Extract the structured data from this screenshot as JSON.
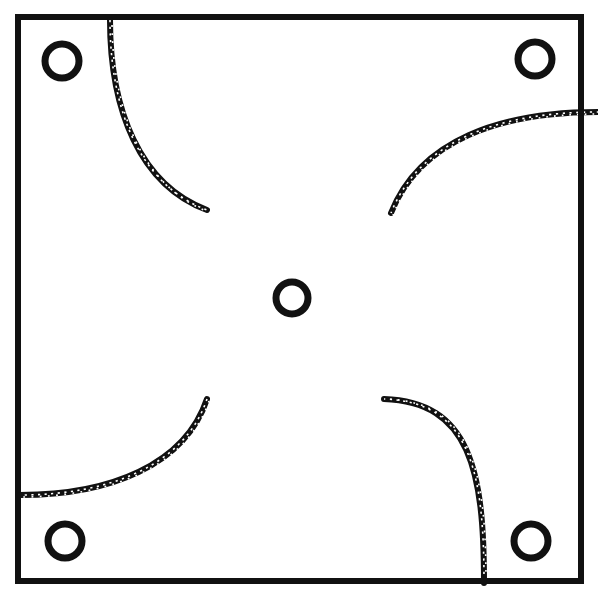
{
  "figure": {
    "canvas": {
      "width": 598,
      "height": 595,
      "background": "#ffffff"
    },
    "ink_color": "#111111",
    "frame": {
      "name": "outer-square-frame",
      "x": 18,
      "y": 17,
      "width": 563,
      "height": 564,
      "stroke_width": 6,
      "stroke_color": "#111111",
      "fill": "none"
    },
    "rings": [
      {
        "id": "ring-top-left",
        "label": "top-left hole",
        "cx": 62,
        "cy": 61,
        "r": 17,
        "stroke_width": 7
      },
      {
        "id": "ring-top-right",
        "label": "top-right hole",
        "cx": 535,
        "cy": 59,
        "r": 17,
        "stroke_width": 7
      },
      {
        "id": "ring-center",
        "label": "center hole",
        "cx": 292,
        "cy": 298,
        "r": 16,
        "stroke_width": 7
      },
      {
        "id": "ring-bottom-left",
        "label": "bottom-left hole",
        "cx": 65,
        "cy": 541,
        "r": 17,
        "stroke_width": 7
      },
      {
        "id": "ring-bottom-right",
        "label": "bottom-right hole",
        "cx": 531,
        "cy": 541,
        "r": 17,
        "stroke_width": 7
      }
    ],
    "arcs": [
      {
        "id": "arc-upper-left",
        "label": "upper-left pinwheel arc",
        "path": "M 110 20 C 110 110, 140 185, 207 210",
        "stroke_width": 6
      },
      {
        "id": "arc-upper-right",
        "label": "upper-right pinwheel arc",
        "path": "M 598 112 C 500 112, 420 140, 391 213",
        "stroke_width": 6
      },
      {
        "id": "arc-lower-left",
        "label": "lower-left pinwheel arc",
        "path": "M 20 495 C 110 495, 185 465, 207 399",
        "stroke_width": 6
      },
      {
        "id": "arc-lower-right",
        "label": "lower-right pinwheel arc",
        "path": "M 384 399 C 470 402, 484 470, 484 583",
        "stroke_width": 6
      }
    ],
    "texture": {
      "name": "speckled-hatch",
      "description": "arcs are drawn with a dashed/speckled white-on-black texture"
    }
  }
}
